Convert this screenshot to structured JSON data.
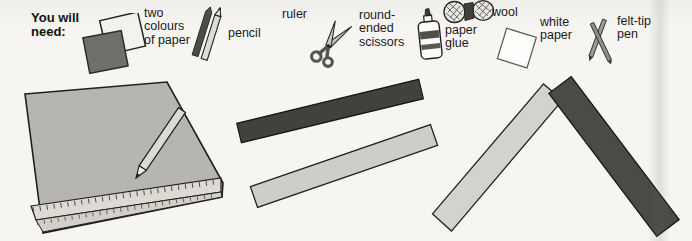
{
  "header": {
    "heading": "You will\nneed:"
  },
  "materials": [
    {
      "label": "two\ncolours\nof paper",
      "icon": "two-papers-icon"
    },
    {
      "label": "pencil",
      "icon": "pencils-icon"
    },
    {
      "label": "ruler",
      "icon": null
    },
    {
      "label": "round-\nended\nscissors",
      "icon": "scissors-icon"
    },
    {
      "label": "paper\nglue",
      "icon": "glue-bottle-icon"
    },
    {
      "label": "wool",
      "icon": "wool-icon"
    },
    {
      "label": "white\npaper",
      "icon": "white-paper-icon"
    },
    {
      "label": "felt-tip\npen",
      "icon": "felt-pens-icon"
    }
  ],
  "colors": {
    "page_background": "#f6f5f2",
    "ink": "#1a1a1a",
    "sheet_gray": "#b6b5b2",
    "ruler_light": "#dcdad3",
    "strip_dark": "#42413d",
    "strip_light": "#cecdc8",
    "chevron_dark": "#4b4a47",
    "chevron_light": "#d3d2ce",
    "dark_paper_square": "#716f6c"
  }
}
